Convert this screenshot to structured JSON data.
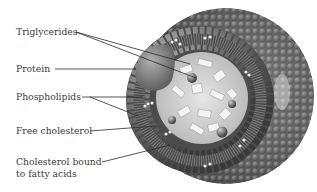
{
  "diagram": {
    "labels": [
      {
        "id": "triglycerides",
        "text": "Triglycerides"
      },
      {
        "id": "protein",
        "text": "Protein"
      },
      {
        "id": "phospholipids",
        "text": "Phospholipids"
      },
      {
        "id": "free-cholesterol",
        "text": "Free cholesterol"
      },
      {
        "id": "cholesterol-bound-1",
        "text": "Cholesterol bound"
      },
      {
        "id": "cholesterol-bound-2",
        "text": "to fatty acids"
      }
    ],
    "colors": {
      "shell": "#6e6e6e",
      "shell_dark": "#3e3e3e",
      "core": "#d4d4d4",
      "protein": "#8a8a8a",
      "leader": "#2a2a2a",
      "text": "#3a3a3a"
    }
  }
}
